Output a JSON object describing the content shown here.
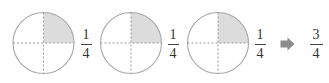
{
  "diagram": {
    "circles": [
      {
        "id": "circle-1",
        "cx": 43.5,
        "cy": 43,
        "r": 30.5,
        "shaded_quadrant": "top-right",
        "label": {
          "numerator": "1",
          "denominator": "4"
        }
      },
      {
        "id": "circle-2",
        "cx": 131,
        "cy": 43,
        "r": 30.5,
        "shaded_quadrant": "top-right",
        "label": {
          "numerator": "1",
          "denominator": "4"
        }
      },
      {
        "id": "circle-3",
        "cx": 218,
        "cy": 43,
        "r": 30.5,
        "shaded_quadrant": "top-right",
        "label": {
          "numerator": "1",
          "denominator": "4"
        }
      }
    ],
    "arrow": {
      "icon": "right-arrow-icon",
      "color": "#8c8c8c"
    },
    "result": {
      "numerator": "3",
      "denominator": "4"
    },
    "colors": {
      "shade": "#dcdcdc",
      "outline": "#a8a8a8",
      "dash": "#9a9a9a",
      "text": "#333333"
    }
  }
}
